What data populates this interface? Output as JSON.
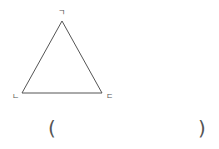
{
  "figure": {
    "shape": "triangle",
    "stroke_color": "#555555",
    "vertices": [
      {
        "label": "ㄱ",
        "x": 62,
        "y": 21
      },
      {
        "label": "ㄴ",
        "x": 22,
        "y": 93
      },
      {
        "label": "ㄷ",
        "x": 102,
        "y": 93
      }
    ]
  },
  "labels": {
    "top": "ㄱ",
    "left": "ㄴ",
    "right": "ㄷ"
  },
  "answer": {
    "open_paren": "(",
    "close_paren": ")",
    "value": ""
  }
}
